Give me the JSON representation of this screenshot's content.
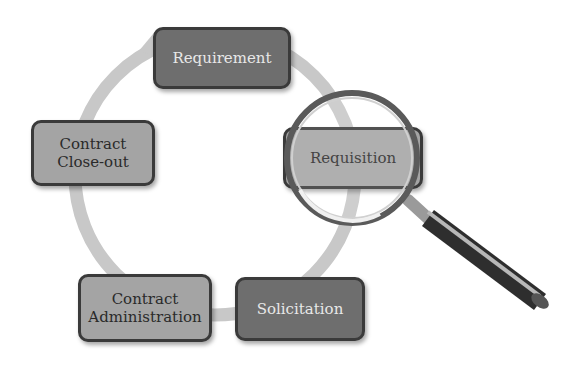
{
  "diagram": {
    "type": "cycle",
    "direction": "clockwise",
    "steps": [
      {
        "label": "Requirement",
        "style": "dark"
      },
      {
        "label": "Requisition",
        "style": "light",
        "highlighted": true
      },
      {
        "label": "Solicitation",
        "style": "dark"
      },
      {
        "label": "Contract\nAdministration",
        "style": "light"
      },
      {
        "label": "Contract\nClose-out",
        "style": "light"
      }
    ],
    "highlight_icon": "magnifying-glass-icon",
    "colors": {
      "ring": "#c8c8c8",
      "dark_box": "#6e6e6e",
      "light_box": "#a4a4a4",
      "border": "#3a3a3a"
    }
  }
}
